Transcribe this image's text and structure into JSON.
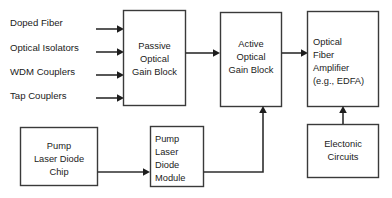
{
  "diagram": {
    "background_color": "#ffffff",
    "line_color": "#2e2e2e",
    "text_color": "#1b1b1b",
    "input_labels": [
      {
        "text": "Doped  Fiber"
      },
      {
        "text": "Optical Isolators"
      },
      {
        "text": "WDM Couplers"
      },
      {
        "text": "Tap Couplers"
      }
    ],
    "blocks": {
      "passive_gain": {
        "lines": [
          "Passive",
          "Optical",
          "Gain Block"
        ]
      },
      "active_gain": {
        "lines": [
          "Active",
          "Optical",
          "Gain Block"
        ]
      },
      "fiber_amplifier": {
        "lines": [
          "Optical",
          "Fiber",
          "Amplifier",
          "(e.g., EDFA)"
        ]
      },
      "pump_chip": {
        "lines": [
          "Pump",
          "Laser Diode",
          "Chip"
        ]
      },
      "pump_module": {
        "lines": [
          "Pump",
          "Laser",
          "Diode",
          "Module"
        ]
      },
      "electronic_circuits": {
        "lines": [
          "Electonic",
          "Circuits"
        ]
      }
    }
  }
}
